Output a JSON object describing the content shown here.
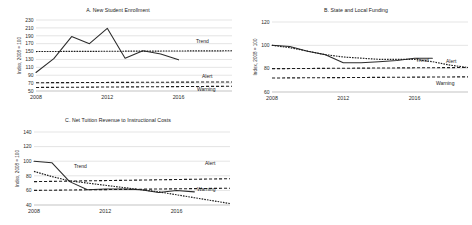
{
  "figure": {
    "panels": [
      "A",
      "B",
      "C"
    ],
    "y_axis_title": "Index, 2008 = 100",
    "series_labels": {
      "trend": "Trend",
      "alert": "Alert",
      "warning": "Warning"
    }
  },
  "chart_data": [
    {
      "id": "A",
      "type": "line",
      "title": "A. New Student Enrollment",
      "xlabel": "",
      "ylabel": "Index, 2008 = 100",
      "ylim": [
        50,
        230
      ],
      "yticks": [
        50,
        70,
        90,
        110,
        130,
        150,
        170,
        190,
        210,
        230
      ],
      "xlim": [
        2008,
        2019
      ],
      "xticks": [
        2008,
        2012,
        2016
      ],
      "xtick_labels": [
        "2008",
        "2012",
        "2016"
      ],
      "grid": true,
      "legend_position": "inline-right",
      "annotations": [
        "Trend",
        "Alert",
        "Warning"
      ],
      "x": [
        2008,
        2009,
        2010,
        2011,
        2012,
        2013,
        2014,
        2015,
        2016
      ],
      "series": [
        {
          "name": "Actual",
          "style": "solid",
          "values": [
            97,
            132,
            188,
            170,
            209,
            133,
            152,
            144,
            129
          ]
        },
        {
          "name": "Trend",
          "style": "dotted",
          "x": [
            2008,
            2019
          ],
          "values": [
            150,
            152
          ]
        },
        {
          "name": "Alert",
          "style": "dashed",
          "x": [
            2008,
            2019
          ],
          "values": [
            71,
            73
          ]
        },
        {
          "name": "Warning",
          "style": "dashed",
          "x": [
            2008,
            2019
          ],
          "values": [
            59,
            62
          ]
        }
      ]
    },
    {
      "id": "B",
      "type": "line",
      "title": "B. State and Local Funding",
      "xlabel": "",
      "ylabel": "Index, 2008 = 100",
      "ylim": [
        60,
        120
      ],
      "yticks": [
        60,
        80,
        100,
        120
      ],
      "xlim": [
        2008,
        2019
      ],
      "xticks": [
        2008,
        2012,
        2016
      ],
      "xtick_labels": [
        "2008",
        "2012",
        "2016"
      ],
      "grid": true,
      "legend_position": "inline-right",
      "annotations": [
        "Trend",
        "Alert",
        "Warning"
      ],
      "x": [
        2008,
        2009,
        2010,
        2011,
        2012,
        2013,
        2014,
        2015,
        2016,
        2017
      ],
      "series": [
        {
          "name": "Actual",
          "style": "solid",
          "values": [
            100,
            99,
            95,
            92,
            85,
            85,
            86,
            87,
            89,
            89
          ]
        },
        {
          "name": "Trend",
          "style": "dotted",
          "x": [
            2008,
            2009,
            2010,
            2011,
            2012,
            2013,
            2014,
            2015,
            2016,
            2017,
            2018,
            2019
          ],
          "values": [
            100,
            98,
            95,
            92,
            90,
            89,
            88,
            88,
            88,
            86,
            83,
            81
          ]
        },
        {
          "name": "Alert",
          "style": "dashed",
          "x": [
            2008,
            2019
          ],
          "values": [
            80,
            81
          ]
        },
        {
          "name": "Warning",
          "style": "dashed",
          "x": [
            2008,
            2019
          ],
          "values": [
            72,
            73
          ]
        }
      ]
    },
    {
      "id": "C",
      "type": "line",
      "title": "C. Net Tuition Revenue to Instructional Costs",
      "xlabel": "",
      "ylabel": "Index, 2008 = 100",
      "ylim": [
        40,
        140
      ],
      "yticks": [
        40,
        60,
        80,
        100,
        120,
        140
      ],
      "xlim": [
        2008,
        2019
      ],
      "xticks": [
        2008,
        2012,
        2016
      ],
      "xtick_labels": [
        "2008",
        "2012",
        "2016"
      ],
      "grid": true,
      "legend_position": "inline-right",
      "annotations": [
        "Trend",
        "Alert",
        "Warning"
      ],
      "x": [
        2008,
        2009,
        2010,
        2011,
        2012,
        2013,
        2014,
        2015,
        2016,
        2017
      ],
      "series": [
        {
          "name": "Actual",
          "style": "solid",
          "values": [
            100,
            98,
            72,
            61,
            62,
            62,
            61,
            57,
            60,
            58
          ]
        },
        {
          "name": "Trend",
          "style": "dotted",
          "x": [
            2008,
            2009,
            2010,
            2011,
            2012,
            2013,
            2014,
            2015,
            2016,
            2017,
            2018,
            2019
          ],
          "values": [
            86,
            79,
            73,
            70,
            67,
            64,
            61,
            58,
            54,
            50,
            46,
            42
          ]
        },
        {
          "name": "Alert",
          "style": "dashed",
          "x": [
            2008,
            2019
          ],
          "values": [
            72,
            76
          ]
        },
        {
          "name": "Warning",
          "style": "dashed",
          "x": [
            2008,
            2019
          ],
          "values": [
            60,
            63
          ]
        }
      ]
    }
  ]
}
